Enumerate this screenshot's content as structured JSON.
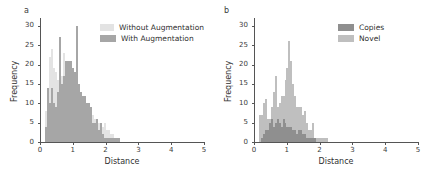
{
  "figure": {
    "width": 432,
    "height": 173,
    "background": "#ffffff"
  },
  "panels": [
    {
      "id": "a",
      "label": "a",
      "xlabel": "Distance",
      "ylabel": "Frequency",
      "xticks": [
        "0",
        "1",
        "2",
        "3",
        "4",
        "5"
      ],
      "yticks": [
        "0",
        "5",
        "10",
        "15",
        "20",
        "25",
        "30"
      ],
      "legend": [
        {
          "label": "Without Augmentation",
          "color": "#e3e3e3"
        },
        {
          "label": "With Augmentation",
          "color": "#a6a6a6"
        }
      ]
    },
    {
      "id": "b",
      "label": "b",
      "xlabel": "Distance",
      "ylabel": "Frequency",
      "xticks": [
        "0",
        "1",
        "2",
        "3",
        "4",
        "5"
      ],
      "yticks": [
        "0",
        "5",
        "10",
        "15",
        "20",
        "25",
        "30"
      ],
      "legend": [
        {
          "label": "Copies",
          "color": "#8f8f8f"
        },
        {
          "label": "Novel",
          "color": "#bfbfbf"
        }
      ]
    }
  ],
  "chart_data": [
    {
      "type": "bar",
      "panel": "a",
      "title": "",
      "xlabel": "Distance",
      "ylabel": "Frequency",
      "xlim": [
        0,
        5
      ],
      "ylim": [
        0,
        32
      ],
      "grid": false,
      "legend_position": "upper right",
      "bin_width": 0.06,
      "bin_starts": [
        0.12,
        0.18,
        0.24,
        0.3,
        0.36,
        0.42,
        0.48,
        0.54,
        0.6,
        0.66,
        0.72,
        0.78,
        0.84,
        0.9,
        0.96,
        1.02,
        1.08,
        1.14,
        1.2,
        1.26,
        1.32,
        1.38,
        1.44,
        1.5,
        1.56,
        1.62,
        1.68,
        1.74,
        1.8,
        1.86,
        1.92,
        1.98,
        2.04,
        2.1,
        2.16,
        2.22,
        2.28,
        2.34,
        2.4
      ],
      "series": [
        {
          "name": "Without Augmentation",
          "color": "#e3e3e3",
          "values": [
            8,
            14,
            22,
            24,
            19,
            18,
            16,
            21,
            17,
            23,
            19,
            13,
            12,
            21,
            18,
            16,
            14,
            13,
            12,
            11,
            10,
            9,
            10,
            8,
            7,
            6,
            6,
            5,
            5,
            4,
            5,
            3,
            3,
            2,
            2,
            1,
            1,
            1,
            0
          ]
        },
        {
          "name": "With Augmentation",
          "color": "#a6a6a6",
          "values": [
            4,
            14,
            10,
            14,
            10,
            9,
            13,
            27,
            15,
            17,
            21,
            21,
            21,
            21,
            19,
            18,
            30,
            15,
            13,
            12,
            12,
            10,
            10,
            9,
            5,
            5,
            6,
            3,
            5,
            2,
            1,
            1,
            1,
            1,
            1,
            1,
            1,
            1,
            0
          ]
        }
      ]
    },
    {
      "type": "bar",
      "panel": "b",
      "title": "",
      "xlabel": "Distance",
      "ylabel": "Frequency",
      "xlim": [
        0,
        5
      ],
      "ylim": [
        0,
        32
      ],
      "grid": false,
      "legend_position": "upper right",
      "bin_width": 0.06,
      "bin_starts": [
        0.12,
        0.18,
        0.24,
        0.3,
        0.36,
        0.42,
        0.48,
        0.54,
        0.6,
        0.66,
        0.72,
        0.78,
        0.84,
        0.9,
        0.96,
        1.02,
        1.08,
        1.14,
        1.2,
        1.26,
        1.32,
        1.38,
        1.44,
        1.5,
        1.56,
        1.62,
        1.68,
        1.74,
        1.8,
        1.86,
        1.92,
        1.98,
        2.04,
        2.1,
        2.16,
        2.22,
        2.28,
        2.34,
        2.4
      ],
      "series": [
        {
          "name": "Novel",
          "color": "#bfbfbf",
          "values": [
            7,
            7,
            10,
            11,
            6,
            6,
            9,
            13,
            17,
            9,
            10,
            12,
            12,
            16,
            19,
            26,
            21,
            15,
            12,
            9,
            9,
            9,
            7,
            8,
            5,
            3,
            3,
            5,
            1,
            1,
            1,
            1,
            1,
            1,
            1,
            0,
            0,
            0,
            0
          ]
        },
        {
          "name": "Copies",
          "color": "#8f8f8f",
          "values": [
            0,
            1,
            2,
            3,
            3,
            5,
            6,
            4,
            5,
            6,
            5,
            4,
            6,
            5,
            4,
            4,
            4,
            3,
            3,
            2,
            3,
            3,
            2,
            2,
            1,
            1,
            1,
            1,
            1,
            0,
            0,
            0,
            0,
            0,
            0,
            0,
            0,
            0,
            0
          ]
        }
      ]
    }
  ]
}
